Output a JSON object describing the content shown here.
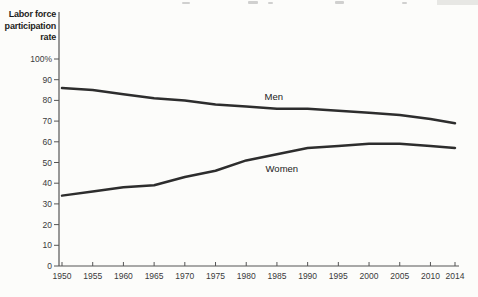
{
  "chart_data": {
    "type": "line",
    "title": "",
    "ylabel": "Labor force participation rate",
    "ylabel_lines": [
      "Labor force",
      "participation",
      "rate"
    ],
    "xlabel": "",
    "x": [
      1950,
      1955,
      1960,
      1965,
      1970,
      1975,
      1980,
      1985,
      1990,
      1995,
      2000,
      2005,
      2010,
      2014
    ],
    "x_tick_labels": [
      "1950",
      "1955",
      "1960",
      "1965",
      "1970",
      "1975",
      "1980",
      "1985",
      "1990",
      "1995",
      "2000",
      "2005",
      "2010",
      "2014"
    ],
    "y_ticks": [
      0,
      10,
      20,
      30,
      40,
      50,
      60,
      70,
      80,
      90,
      100
    ],
    "y_tick_top_label": "100%",
    "ylim": [
      0,
      100
    ],
    "xlim": [
      1950,
      2014
    ],
    "grid": false,
    "legend": "inline-labels",
    "line_color": "#2d2d2d",
    "axis_color": "#555555",
    "tick_label_color": "#3a3a3a",
    "series_label_color": "#222222",
    "series": [
      {
        "name": "Men",
        "values": [
          86,
          85,
          83,
          81,
          80,
          78,
          77,
          76,
          76,
          75,
          74,
          73,
          71,
          69
        ],
        "label_anchor": {
          "year": 1984.5,
          "value": 80
        }
      },
      {
        "name": "Women",
        "values": [
          34,
          36,
          38,
          39,
          43,
          46,
          51,
          54,
          57,
          58,
          59,
          59,
          58,
          57
        ],
        "label_anchor": {
          "year": 1985.8,
          "value": 45.5
        }
      }
    ]
  }
}
